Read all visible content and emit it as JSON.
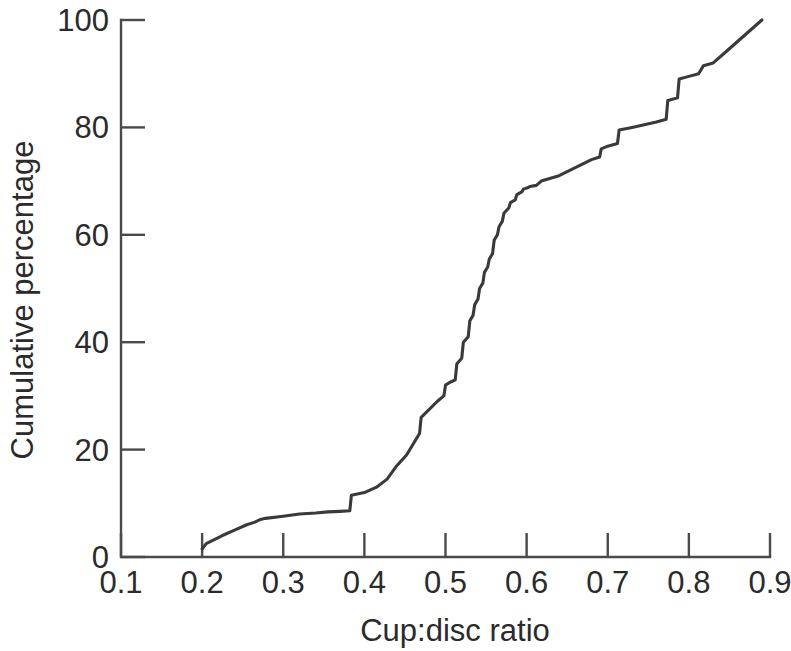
{
  "chart_data": {
    "type": "line",
    "title": "",
    "xlabel": "Cup:disc ratio",
    "ylabel": "Cumulative percentage",
    "xlim": [
      0.1,
      0.9
    ],
    "ylim": [
      0,
      100
    ],
    "xticks": [
      "0.1",
      "0.2",
      "0.3",
      "0.4",
      "0.5",
      "0.6",
      "0.7",
      "0.8",
      "0.9"
    ],
    "xtick_values": [
      0.1,
      0.2,
      0.3,
      0.4,
      0.5,
      0.6,
      0.7,
      0.8,
      0.9
    ],
    "yticks": [
      "0",
      "20",
      "40",
      "60",
      "80",
      "100"
    ],
    "ytick_values": [
      0,
      20,
      40,
      60,
      80,
      100
    ],
    "grid": false,
    "legend": false,
    "line_color": "#3a3a3a",
    "axis_color": "#4a4a4a",
    "background_color": "#ffffff",
    "series": [
      {
        "name": "Cumulative percentage",
        "x": [
          0.2,
          0.205,
          0.225,
          0.24,
          0.255,
          0.265,
          0.272,
          0.278,
          0.3,
          0.32,
          0.34,
          0.355,
          0.37,
          0.382,
          0.384,
          0.4,
          0.415,
          0.428,
          0.44,
          0.452,
          0.46,
          0.468,
          0.47,
          0.48,
          0.49,
          0.498,
          0.5,
          0.505,
          0.512,
          0.514,
          0.52,
          0.522,
          0.528,
          0.53,
          0.534,
          0.536,
          0.54,
          0.542,
          0.546,
          0.548,
          0.552,
          0.554,
          0.558,
          0.56,
          0.564,
          0.566,
          0.57,
          0.572,
          0.578,
          0.58,
          0.586,
          0.588,
          0.594,
          0.596,
          0.602,
          0.604,
          0.612,
          0.618,
          0.64,
          0.66,
          0.68,
          0.69,
          0.692,
          0.7,
          0.712,
          0.714,
          0.73,
          0.745,
          0.76,
          0.772,
          0.774,
          0.786,
          0.788,
          0.8,
          0.812,
          0.818,
          0.83,
          0.845,
          0.86,
          0.875,
          0.89
        ],
        "y": [
          1.5,
          2.5,
          4.0,
          5.0,
          6.0,
          6.5,
          7.0,
          7.2,
          7.6,
          8.0,
          8.2,
          8.4,
          8.5,
          8.6,
          11.5,
          12.0,
          13.0,
          14.5,
          17.0,
          19.0,
          21.0,
          23.0,
          26.0,
          27.5,
          29.0,
          30.0,
          32.0,
          32.5,
          33.0,
          36.0,
          37.0,
          40.0,
          41.0,
          44.0,
          45.0,
          47.0,
          48.0,
          50.0,
          51.0,
          53.0,
          54.0,
          55.5,
          56.5,
          59.0,
          60.0,
          61.5,
          62.5,
          64.0,
          65.0,
          66.0,
          66.5,
          67.5,
          68.0,
          68.5,
          68.8,
          69.0,
          69.2,
          70.0,
          71.0,
          72.5,
          74.0,
          74.5,
          76.0,
          76.5,
          77.0,
          79.5,
          80.0,
          80.5,
          81.0,
          81.5,
          85.0,
          85.5,
          89.0,
          89.5,
          90.0,
          91.5,
          92.0,
          94.0,
          96.0,
          98.0,
          100.0
        ]
      }
    ]
  },
  "axis": {
    "x_title": "Cup:disc ratio",
    "y_title": "Cumulative percentage"
  }
}
